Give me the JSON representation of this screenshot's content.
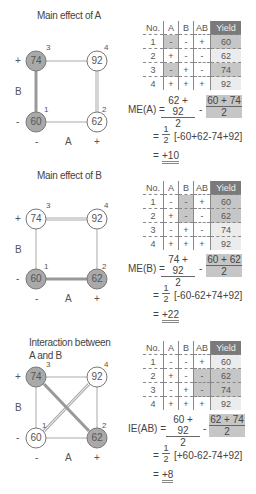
{
  "panels": [
    {
      "title": "Main effect of A",
      "axis": {
        "b_label": "B",
        "a_label": "A",
        "plus": "+",
        "minus": "-"
      },
      "nodes": {
        "n1": {
          "id": "1",
          "value": "60"
        },
        "n2": {
          "id": "2",
          "value": "62"
        },
        "n3": {
          "id": "3",
          "value": "74"
        },
        "n4": {
          "id": "4",
          "value": "92"
        }
      },
      "table": {
        "headers": [
          "No.",
          "A",
          "B",
          "AB",
          "Yield"
        ],
        "rows": [
          [
            "1",
            "-",
            "-",
            "+",
            "60"
          ],
          [
            "2",
            "+",
            "-",
            "-",
            "62"
          ],
          [
            "3",
            "-",
            "+",
            "-",
            "74"
          ],
          [
            "4",
            "+",
            "+",
            "+",
            "92"
          ]
        ]
      },
      "formula": {
        "lhs": "ME(A) =",
        "num1": "62 + 92",
        "den1": "2",
        "minus": "-",
        "num2": "60 + 74",
        "den2": "2",
        "step_eq": "=",
        "half_num": "1",
        "half_den": "2",
        "bracket": "[-60+62-74+92]",
        "result_eq": "=",
        "result": "+10"
      }
    },
    {
      "title": "Main effect of B",
      "axis": {
        "b_label": "B",
        "a_label": "A",
        "plus": "+",
        "minus": "-"
      },
      "nodes": {
        "n1": {
          "id": "1",
          "value": "60"
        },
        "n2": {
          "id": "2",
          "value": "62"
        },
        "n3": {
          "id": "3",
          "value": "74"
        },
        "n4": {
          "id": "4",
          "value": "92"
        }
      },
      "table": {
        "headers": [
          "No.",
          "A",
          "B",
          "AB",
          "Yield"
        ],
        "rows": [
          [
            "1",
            "-",
            "-",
            "+",
            "60"
          ],
          [
            "2",
            "+",
            "-",
            "-",
            "62"
          ],
          [
            "3",
            "-",
            "+",
            "-",
            "74"
          ],
          [
            "4",
            "+",
            "+",
            "+",
            "92"
          ]
        ]
      },
      "formula": {
        "lhs": "ME(B) =",
        "num1": "74 + 92",
        "den1": "2",
        "minus": "-",
        "num2": "60 + 62",
        "den2": "2",
        "step_eq": "=",
        "half_num": "1",
        "half_den": "2",
        "bracket": "[-60-62+74+92]",
        "result_eq": "=",
        "result": "+22"
      }
    },
    {
      "title": "Interaction between",
      "title2": "A and B",
      "axis": {
        "b_label": "B",
        "a_label": "A",
        "plus": "+",
        "minus": "-"
      },
      "nodes": {
        "n1": {
          "id": "1",
          "value": "60"
        },
        "n2": {
          "id": "2",
          "value": "62"
        },
        "n3": {
          "id": "3",
          "value": "74"
        },
        "n4": {
          "id": "4",
          "value": "92"
        }
      },
      "table": {
        "headers": [
          "No.",
          "A",
          "B",
          "AB",
          "Yield"
        ],
        "rows": [
          [
            "1",
            "-",
            "-",
            "+",
            "60"
          ],
          [
            "2",
            "+",
            "-",
            "-",
            "62"
          ],
          [
            "3",
            "-",
            "+",
            "-",
            "74"
          ],
          [
            "4",
            "+",
            "+",
            "+",
            "92"
          ]
        ]
      },
      "formula": {
        "lhs": "IE(AB) =",
        "num1": "60 + 92",
        "den1": "2",
        "minus": "-",
        "num2": "62 + 74",
        "den2": "2",
        "step_eq": "=",
        "half_num": "1",
        "half_den": "2",
        "bracket": "[+60-62-74+92]",
        "result_eq": "=",
        "result": "+8"
      }
    }
  ],
  "colors": {
    "shaded_node": "#a9a9a9",
    "shaded_cell": "#c6c6c6",
    "yield_header": "#7a7a7a",
    "line": "#999999",
    "strong_line": "#8a8a8a"
  }
}
